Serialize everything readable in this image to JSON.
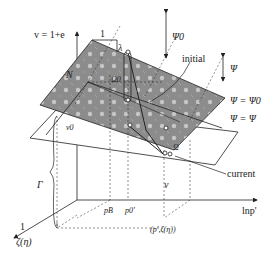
{
  "diagram": {
    "axes": {
      "vertical": {
        "label": "v = 1+e"
      },
      "horizontal": {
        "label": "lnp'"
      },
      "depth": {
        "label": "ζ(η)",
        "unit_mark": "1"
      }
    },
    "slope_markers": {
      "run": "1",
      "lambda": "λ",
      "kappa_label": "N"
    },
    "labels": {
      "psi0_arrow": "Ψ0",
      "psi_arrow": "Ψ",
      "initial": "initial",
      "current": "current",
      "plane_psi0": "Ψ = Ψ0",
      "plane_psi": "Ψ = Ψ",
      "omega0": "Ω0",
      "omega": "Ω",
      "v0": "v0",
      "v": "v",
      "gamma": "Γ",
      "pB": "pB",
      "p0": "p0'",
      "point": "(p',ζ(η))"
    },
    "colors": {
      "plane_fill": "#8f8f8f",
      "plane_highlight": "#d8d8d8",
      "line": "#222222",
      "background": "#ffffff"
    }
  }
}
